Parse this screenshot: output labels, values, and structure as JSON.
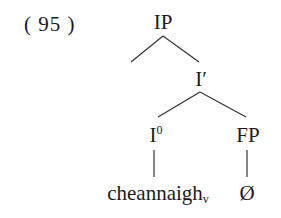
{
  "example": {
    "number_label": "( 95 )"
  },
  "tree": {
    "nodes": {
      "ip": {
        "label": "IP"
      },
      "ibar": {
        "label": "I′"
      },
      "i0": {
        "label": "I",
        "sup": "0"
      },
      "fp": {
        "label": "FP"
      },
      "verb": {
        "label": "cheannaigh",
        "sub": "v"
      },
      "empty": {
        "label": "Ø"
      }
    },
    "edges": [
      [
        "ip",
        "left-branch"
      ],
      [
        "ip",
        "ibar"
      ],
      [
        "ibar",
        "i0"
      ],
      [
        "ibar",
        "fp"
      ],
      [
        "i0",
        "verb"
      ],
      [
        "fp",
        "empty"
      ]
    ],
    "line_color": "#333333"
  }
}
